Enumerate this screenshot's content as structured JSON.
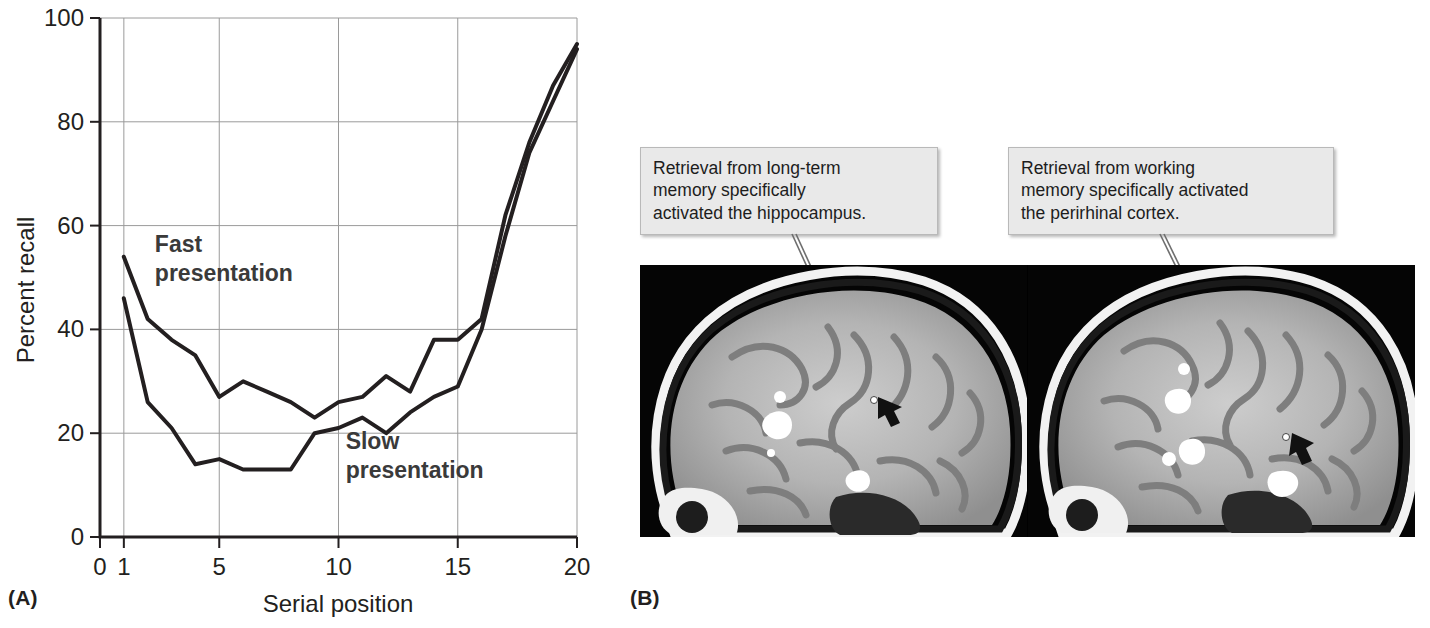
{
  "figure": {
    "panel_a_label": "(A)",
    "panel_b_label": "(B)"
  },
  "chart_data": {
    "type": "line",
    "title": "",
    "xlabel": "Serial position",
    "ylabel": "Percent recall",
    "xlim": [
      0,
      20
    ],
    "ylim": [
      0,
      100
    ],
    "xticks": [
      0,
      1,
      5,
      10,
      15,
      20
    ],
    "yticks": [
      0,
      20,
      40,
      60,
      80,
      100
    ],
    "grid": true,
    "legend_position": "inline-annotations",
    "x": [
      1,
      2,
      3,
      4,
      5,
      6,
      7,
      8,
      9,
      10,
      11,
      12,
      13,
      14,
      15,
      16,
      17,
      18,
      19,
      20
    ],
    "series": [
      {
        "name": "Fast presentation",
        "values": [
          54,
          42,
          38,
          35,
          27,
          30,
          28,
          26,
          23,
          26,
          27,
          31,
          28,
          38,
          38,
          42,
          62,
          76,
          87,
          95
        ]
      },
      {
        "name": "Slow presentation",
        "values": [
          46,
          26,
          21,
          14,
          15,
          13,
          13,
          13,
          20,
          21,
          23,
          20,
          24,
          27,
          29,
          40,
          58,
          74,
          84,
          94
        ]
      }
    ],
    "annotations": [
      {
        "text": "Fast\npresentation",
        "x": 2.3,
        "y": 55
      },
      {
        "text": "Slow\npresentation",
        "x": 10.3,
        "y": 17
      }
    ]
  },
  "panel_b": {
    "callout_left": "Retrieval from long-term\nmemory specifically\nactivated the hippocampus.",
    "callout_right": "Retrieval from working\nmemory specifically activated\nthe perirhinal cortex.",
    "image_left_alt": "sagittal-mri-left",
    "image_right_alt": "sagittal-mri-right"
  },
  "colors": {
    "ink": "#231f20",
    "grid": "#9a9a9a",
    "callout_bg": "#e9e9e9",
    "callout_border": "#b9b9b9",
    "mri_background": "#000000"
  }
}
